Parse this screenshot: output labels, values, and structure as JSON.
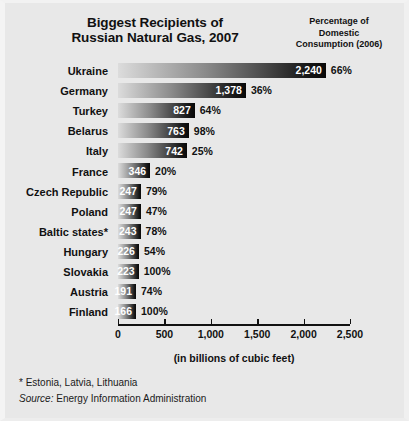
{
  "header": {
    "title": "Biggest Recipients of\nRussian Natural Gas, 2007",
    "title_line1": "Biggest Recipients of",
    "title_line2": "Russian Natural Gas, 2007",
    "column_header": "Percentage of\nDomestic\nConsumption (2006)",
    "column_header_line1": "Percentage of",
    "column_header_line2": "Domestic",
    "column_header_line3": "Consumption (2006)"
  },
  "footer": {
    "footnote": "* Estonia, Latvia, Lithuania",
    "source_word": "Source:",
    "source_text": " Energy Information Administration"
  },
  "chart_data": {
    "type": "bar",
    "orientation": "horizontal",
    "title": "Biggest Recipients of Russian Natural Gas, 2007",
    "xlabel": "(in billions of cubic feet)",
    "ylabel": "",
    "xlim": [
      0,
      2500
    ],
    "xticks": [
      0,
      500,
      1000,
      1500,
      2000,
      2500
    ],
    "xtick_labels": [
      "0",
      "500",
      "1,000",
      "1,500",
      "2,000",
      "2,500"
    ],
    "grid": false,
    "legend": false,
    "value_unit": "billions of cubic feet",
    "secondary_column_label": "Percentage of Domestic Consumption (2006)",
    "categories": [
      "Ukraine",
      "Germany",
      "Turkey",
      "Belarus",
      "Italy",
      "France",
      "Czech Republic",
      "Poland",
      "Baltic states*",
      "Hungary",
      "Slovakia",
      "Austria",
      "Finland"
    ],
    "values": [
      2240,
      1378,
      827,
      763,
      742,
      346,
      247,
      247,
      243,
      226,
      223,
      191,
      166
    ],
    "value_labels": [
      "2,240",
      "1,378",
      "827",
      "763",
      "742",
      "346",
      "247",
      "247",
      "243",
      "226",
      "223",
      "191",
      "166"
    ],
    "percentages": [
      66,
      36,
      64,
      98,
      25,
      20,
      79,
      47,
      78,
      54,
      100,
      74,
      100
    ],
    "percent_labels": [
      "66%",
      "36%",
      "64%",
      "98%",
      "25%",
      "20%",
      "79%",
      "47%",
      "78%",
      "54%",
      "100%",
      "74%",
      "100%"
    ],
    "rows": [
      {
        "label": "Ukraine",
        "value": 2240,
        "value_label": "2,240",
        "percent_label": "66%"
      },
      {
        "label": "Germany",
        "value": 1378,
        "value_label": "1,378",
        "percent_label": "36%"
      },
      {
        "label": "Turkey",
        "value": 827,
        "value_label": "827",
        "percent_label": "64%"
      },
      {
        "label": "Belarus",
        "value": 763,
        "value_label": "763",
        "percent_label": "98%"
      },
      {
        "label": "Italy",
        "value": 742,
        "value_label": "742",
        "percent_label": "25%"
      },
      {
        "label": "France",
        "value": 346,
        "value_label": "346",
        "percent_label": "20%"
      },
      {
        "label": "Czech Republic",
        "value": 247,
        "value_label": "247",
        "percent_label": "79%"
      },
      {
        "label": "Poland",
        "value": 247,
        "value_label": "247",
        "percent_label": "47%"
      },
      {
        "label": "Baltic states*",
        "value": 243,
        "value_label": "243",
        "percent_label": "78%"
      },
      {
        "label": "Hungary",
        "value": 226,
        "value_label": "226",
        "percent_label": "54%"
      },
      {
        "label": "Slovakia",
        "value": 223,
        "value_label": "223",
        "percent_label": "100%"
      },
      {
        "label": "Austria",
        "value": 191,
        "value_label": "191",
        "percent_label": "74%"
      },
      {
        "label": "Finland",
        "value": 166,
        "value_label": "166",
        "percent_label": "100%"
      }
    ]
  },
  "colors": {
    "background": "#e8e8e8",
    "text": "#111111",
    "bar_start": "#dcdcdc",
    "bar_end": "#080808",
    "value_text": "#ffffff"
  }
}
